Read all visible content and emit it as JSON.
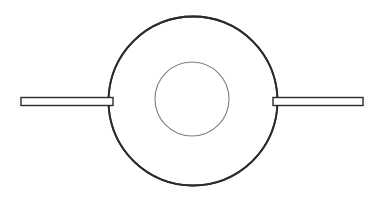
{
  "canvas": {
    "width": 384,
    "height": 202,
    "background_color": "#ffffff",
    "title": "Line drawing of a circular body with two horizontal shafts"
  },
  "palette": {
    "outline_dark": "#2b2b2b",
    "outline_light": "#7d7d7d",
    "fill_white": "#ffffff"
  },
  "figure": {
    "outer_circle": {
      "label": "outer circle",
      "cx": 193,
      "cy": 101,
      "r": 84.5,
      "stroke": "#2b2b2b",
      "stroke_width": 1.8,
      "fill": "#ffffff"
    },
    "inner_circle": {
      "label": "inner circle",
      "cx": 192,
      "cy": 99,
      "r": 37,
      "stroke": "#7d7d7d",
      "stroke_width": 1.1,
      "fill": "none"
    },
    "left_bar": {
      "label": "left horizontal shaft",
      "x": 21,
      "y": 97.5,
      "width": 92,
      "height": 8,
      "stroke": "#2b2b2b",
      "stroke_width": 1.4,
      "fill": "#ffffff"
    },
    "right_bar": {
      "label": "right horizontal shaft",
      "x": 273,
      "y": 97.5,
      "width": 90,
      "height": 8,
      "stroke": "#2b2b2b",
      "stroke_width": 1.4,
      "fill": "#ffffff"
    }
  }
}
